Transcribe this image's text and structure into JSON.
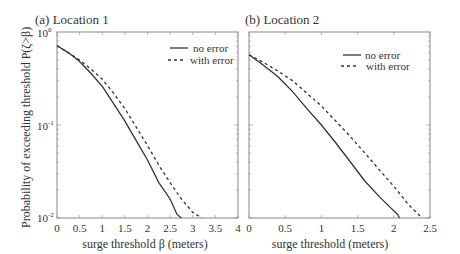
{
  "chart_data": [
    {
      "type": "line",
      "title": "(a) Location 1",
      "xlabel": "surge threshold β (meters)",
      "ylabel": "Probability of exceeding threshold  P(ζ>β)",
      "xlim": [
        0,
        4
      ],
      "ylim": [
        0.01,
        1
      ],
      "yscale": "log",
      "xticks": [
        "0",
        "0.5",
        "1",
        "1.5",
        "2",
        "2.5",
        "3",
        "3.5",
        "4"
      ],
      "yticks": [
        "10^0",
        "10^-1",
        "10^-2"
      ],
      "grid": false,
      "legend_position": "upper right",
      "series": [
        {
          "name": "no error",
          "style": "solid",
          "x": [
            0,
            0.25,
            0.5,
            0.75,
            1.0,
            1.25,
            1.5,
            1.75,
            2.0,
            2.25,
            2.5,
            2.65,
            2.75
          ],
          "y": [
            0.71,
            0.6,
            0.48,
            0.36,
            0.26,
            0.17,
            0.11,
            0.068,
            0.042,
            0.024,
            0.016,
            0.011,
            0.01
          ]
        },
        {
          "name": "with error",
          "style": "dashed",
          "x": [
            0,
            0.25,
            0.5,
            0.75,
            1.0,
            1.25,
            1.5,
            1.75,
            2.0,
            2.25,
            2.5,
            2.75,
            3.0,
            3.2
          ],
          "y": [
            0.71,
            0.6,
            0.5,
            0.4,
            0.31,
            0.22,
            0.15,
            0.095,
            0.06,
            0.037,
            0.024,
            0.016,
            0.0115,
            0.01
          ]
        }
      ]
    },
    {
      "type": "line",
      "title": "(b) Location 2",
      "xlabel": "surge threshold (meters)",
      "ylabel": "",
      "xlim": [
        0,
        2.5
      ],
      "ylim": [
        0.01,
        1
      ],
      "yscale": "log",
      "xticks": [
        "0",
        "0.5",
        "1",
        "1.5",
        "2",
        "2.5"
      ],
      "grid": false,
      "legend_position": "upper right",
      "series": [
        {
          "name": "no error",
          "style": "solid",
          "x": [
            0,
            0.2,
            0.4,
            0.6,
            0.8,
            1.0,
            1.2,
            1.4,
            1.6,
            1.8,
            1.95,
            2.05,
            2.08
          ],
          "y": [
            0.57,
            0.44,
            0.33,
            0.23,
            0.15,
            0.1,
            0.064,
            0.04,
            0.025,
            0.017,
            0.013,
            0.011,
            0.01
          ]
        },
        {
          "name": "with error",
          "style": "dashed",
          "x": [
            0,
            0.2,
            0.4,
            0.6,
            0.8,
            1.0,
            1.2,
            1.4,
            1.6,
            1.8,
            2.0,
            2.2,
            2.39
          ],
          "y": [
            0.57,
            0.47,
            0.38,
            0.3,
            0.22,
            0.16,
            0.11,
            0.075,
            0.05,
            0.033,
            0.022,
            0.014,
            0.01
          ]
        }
      ]
    }
  ],
  "panels": [
    {
      "title": "(a) Location 1",
      "xlabel": "surge threshold β (meters)",
      "legend": [
        "no error",
        "with error"
      ]
    },
    {
      "title": "(b) Location 2",
      "xlabel": "surge threshold (meters)",
      "legend": [
        "no error",
        "with error"
      ]
    }
  ],
  "ylabel": "Probability of exceeding threshold  P(ζ>β)",
  "ytick_labels": {
    "top": "10",
    "top_exp": "0",
    "mid": "10",
    "mid_exp": "-1",
    "bot": "10",
    "bot_exp": "-2"
  },
  "colors": {
    "line": "#333333",
    "axis": "#777777"
  }
}
